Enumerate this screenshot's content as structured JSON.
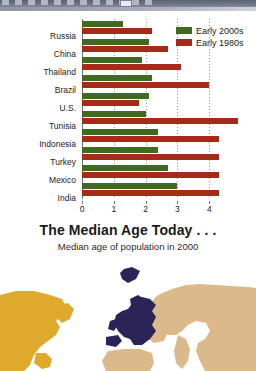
{
  "window": {
    "title_bar_visible": true
  },
  "chart_data": {
    "type": "bar",
    "orientation": "horizontal",
    "title": "",
    "xlabel": "",
    "ylabel": "",
    "xlim": [
      0,
      4.4
    ],
    "xticks": [
      0,
      1,
      2,
      3,
      4
    ],
    "xtick_labels": [
      "0",
      "1",
      "2",
      "3",
      "4"
    ],
    "grid": true,
    "legend_position": "top-right",
    "categories": [
      "Russia",
      "China",
      "Thailand",
      "Brazil",
      "U.S.",
      "Tunisia",
      "Indonesia",
      "Turkey",
      "Mexico",
      "India"
    ],
    "series": [
      {
        "name": "Early 2000s",
        "color": "#3f6b21",
        "values": [
          1.3,
          2.1,
          1.9,
          2.2,
          2.1,
          2.0,
          2.4,
          2.4,
          2.7,
          3.0
        ]
      },
      {
        "name": "Early 1980s",
        "color": "#a62a19",
        "values": [
          2.2,
          2.7,
          3.1,
          4.0,
          1.8,
          4.9,
          4.3,
          4.3,
          4.3,
          4.3
        ]
      }
    ]
  },
  "legend": {
    "items": [
      {
        "label": "Early 2000s",
        "color": "#3f6b21"
      },
      {
        "label": "Early 1980s",
        "color": "#a62a19"
      }
    ]
  },
  "median_age_section": {
    "title": "The Median Age Today . . .",
    "subtitle": "Median age of population in 2000"
  },
  "map": {
    "regions": [
      {
        "name": "north-america",
        "color": "#dfa92e"
      },
      {
        "name": "europe",
        "color": "#2c2357"
      },
      {
        "name": "asia",
        "color": "#dcb98a"
      },
      {
        "name": "greenland",
        "color": "#2c2357"
      }
    ]
  },
  "colors": {
    "green": "#3f6b21",
    "red": "#a62a19",
    "axis": "#6e7378",
    "text": "#232323"
  }
}
